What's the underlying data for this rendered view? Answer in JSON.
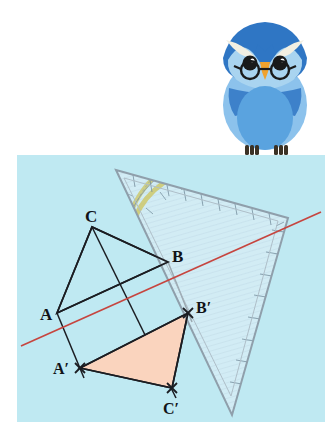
{
  "page": {
    "background_color": "#ffffff",
    "panel_color": "#bfe9f2"
  },
  "mascot": {
    "name": "owl-mascot",
    "description": "blue owl with round glasses",
    "colors": {
      "head_dark": "#2f76c4",
      "face_light": "#a9d4f0",
      "body_mid": "#5aa3df",
      "body_light": "#8cc2ec",
      "brow_cream": "#f2efe2",
      "beak_orange": "#f0a22e",
      "eye_black": "#1a1a1a",
      "feet_dark": "#3b3226"
    }
  },
  "figure": {
    "type": "geometry-construction",
    "caption": "Achsenspiegelung",
    "mirror_axis": {
      "name": "mirror-axis",
      "color": "#c6453f",
      "x1": 21,
      "y1": 346,
      "x2": 321,
      "y2": 212
    },
    "original_triangle": {
      "name": "triangle-ABC",
      "fill": "none",
      "stroke": "#1b1d22",
      "vertices": [
        {
          "label": "A",
          "x": 57,
          "y": 313,
          "marker": "none",
          "label_x": 43,
          "label_y": 318
        },
        {
          "label": "B",
          "x": 168,
          "y": 262,
          "marker": "none",
          "label_x": 172,
          "label_y": 258
        },
        {
          "label": "C",
          "x": 92,
          "y": 227,
          "marker": "none",
          "label_x": 88,
          "label_y": 219
        }
      ]
    },
    "image_triangle": {
      "name": "triangle-A-prime-B-prime-C-prime",
      "fill": "#fad4be",
      "stroke": "#1b1d22",
      "vertices": [
        {
          "label": "A′",
          "x": 80,
          "y": 368,
          "marker": "cross",
          "label_x": 61,
          "label_y": 372
        },
        {
          "label": "B′",
          "x": 188,
          "y": 313,
          "marker": "cross",
          "label_x": 196,
          "label_y": 311
        },
        {
          "label": "C′",
          "x": 172,
          "y": 388,
          "marker": "cross",
          "label_x": 172,
          "label_y": 412
        }
      ]
    },
    "construction_lines": [
      {
        "name": "perpendicular-A-to-Aprime",
        "x1": 57,
        "y1": 313,
        "x2": 82,
        "y2": 374
      },
      {
        "name": "perpendicular-B-to-Bprime",
        "x1": 168,
        "y1": 262,
        "x2": 190,
        "y2": 319
      },
      {
        "name": "perpendicular-C-to-Cprime",
        "x1": 92,
        "y1": 227,
        "x2": 174,
        "y2": 394
      }
    ],
    "set_square": {
      "name": "geodreieck",
      "description": "transparent 45-degree set square with protractor scale",
      "corners": [
        {
          "x": 116,
          "y": 170
        },
        {
          "x": 288,
          "y": 218
        },
        {
          "x": 232,
          "y": 415
        }
      ],
      "body_color": "#dceef7",
      "edge_color": "#8c9aa6",
      "scale_color": "#cfc86a",
      "hatch_color": "#9fb4c4"
    }
  },
  "labels": {
    "A": "A",
    "B": "B",
    "C": "C",
    "A_prime": "A′",
    "B_prime": "B′",
    "C_prime": "C′"
  }
}
